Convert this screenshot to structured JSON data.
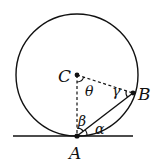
{
  "diagram": {
    "points": {
      "C": {
        "label": "C",
        "x": 77,
        "y": 75
      },
      "A": {
        "label": "A",
        "x": 77,
        "y": 136
      },
      "B": {
        "label": "B",
        "x": 133,
        "y": 93
      }
    },
    "circle": {
      "cx": 77,
      "cy": 75,
      "r": 61
    },
    "ground_line": {
      "x1": 13,
      "y1": 136,
      "x2": 133,
      "y2": 136
    },
    "angles": {
      "theta": "θ",
      "gamma": "γ",
      "beta": "β",
      "alpha": "α"
    },
    "stroke_color": "#111111"
  }
}
